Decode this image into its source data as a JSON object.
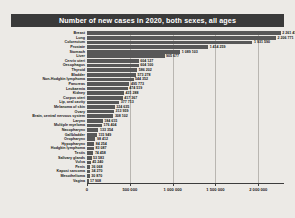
{
  "title": "Number of new cases in 2020, both sexes, all ages",
  "colors": {
    "banner_bg": "#3a3a3a",
    "banner_text": "#ffffff",
    "bar": "#585858",
    "page_bg": "#eceae6",
    "grid": "#b9b6b1",
    "axis": "#3d3d3d"
  },
  "chart_data": {
    "type": "bar",
    "orientation": "horizontal",
    "title": "Number of new cases in 2020, both sexes, all ages",
    "xlabel": "",
    "ylabel": "",
    "xlim": [
      0,
      2300000
    ],
    "grid": true,
    "legend": "none",
    "xticks": [
      0,
      500000,
      1000000,
      1500000,
      2000000
    ],
    "xtick_labels": [
      "0",
      "500 000",
      "1 000 000",
      "1 500 000",
      "2 000 000"
    ],
    "categories": [
      "Breast",
      "Lung",
      "Colorectum",
      "Prostate",
      "Stomach",
      "Liver",
      "Cervix uteri",
      "Oesophagus",
      "Thyroid",
      "Bladder",
      "Non-Hodgkin lymphoma",
      "Pancreas",
      "Leukaemia",
      "Kidney",
      "Corpus uteri",
      "Lip, oral cavity",
      "Melanoma of skin",
      "Ovary",
      "Brain, central nervous system",
      "Larynx",
      "Multiple myeloma",
      "Nasopharynx",
      "Gallbladder",
      "Oropharynx",
      "Hypopharynx",
      "Hodgkin lymphoma",
      "Testis",
      "Salivary glands",
      "Vulva",
      "Penis",
      "Kaposi sarcoma",
      "Mesothelioma",
      "Vagina"
    ],
    "values": [
      2261419,
      2206771,
      1931590,
      1414259,
      1089103,
      905677,
      604127,
      604100,
      586202,
      573278,
      544352,
      495773,
      474519,
      431288,
      417367,
      377713,
      324635,
      313959,
      308102,
      184615,
      176404,
      133354,
      115949,
      98412,
      84254,
      83087,
      74458,
      53583,
      45240,
      36068,
      34270,
      30870,
      17908
    ],
    "value_labels": [
      "2 261 419",
      "2 206 771",
      "1 931 590",
      "1 414 259",
      "1 089 103",
      "905 677",
      "604 127",
      "604 100",
      "586 202",
      "573 278",
      "544 352",
      "495 773",
      "474 519",
      "431 288",
      "417 367",
      "377 713",
      "324 635",
      "313 959",
      "308 102",
      "184 615",
      "176 404",
      "133 354",
      "115 949",
      "98 412",
      "84 254",
      "83 087",
      "74 458",
      "53 583",
      "45 240",
      "36 068",
      "34 270",
      "30 870",
      "17 908"
    ]
  }
}
